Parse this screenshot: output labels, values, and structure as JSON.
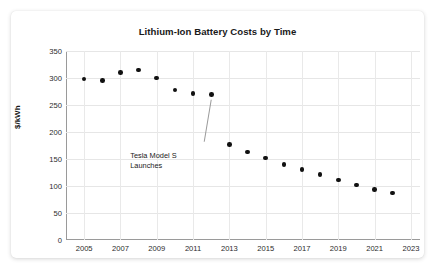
{
  "card": {
    "background": "#ffffff"
  },
  "chart_data": {
    "type": "scatter",
    "title": "Lithium-Ion Battery Costs by Time",
    "xlabel": "",
    "ylabel": "$/kWh",
    "x": [
      2005,
      2006,
      2007,
      2008,
      2009,
      2010,
      2011,
      2012,
      2013,
      2014,
      2015,
      2016,
      2017,
      2018,
      2019,
      2020,
      2021,
      2022
    ],
    "values": [
      298,
      295,
      310,
      315,
      300,
      278,
      271,
      269,
      177,
      163,
      152,
      140,
      131,
      121,
      111,
      102,
      94,
      87
    ],
    "xlim": [
      2004,
      2023.5
    ],
    "ylim": [
      0,
      350
    ],
    "ytick_labels": [
      "0",
      "50",
      "100",
      "150",
      "200",
      "250",
      "300",
      "350"
    ],
    "ytick_values": [
      0,
      50,
      100,
      150,
      200,
      250,
      300,
      350
    ],
    "xtick_labels": [
      "2005",
      "2007",
      "2009",
      "2011",
      "2013",
      "2015",
      "2017",
      "2019",
      "2021",
      "2023"
    ],
    "xtick_values": [
      2005,
      2007,
      2009,
      2011,
      2013,
      2015,
      2017,
      2019,
      2021,
      2023
    ],
    "grid": true,
    "legend": null,
    "marker_color": "#111111",
    "grid_color": "#e6e6e6",
    "annotations": [
      {
        "text_line1": "Tesla Model S",
        "text_line2": "Launches",
        "target_x": 2012,
        "target_y": 269
      }
    ]
  }
}
